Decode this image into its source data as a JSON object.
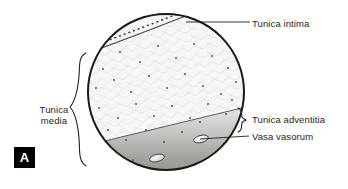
{
  "figure": {
    "panel_letter": "A",
    "background_color": "#ffffff",
    "text_color": "#231f20"
  },
  "labels": {
    "tunica_intima": "Tunica intima",
    "tunica_media_line1": "Tunica",
    "tunica_media_line2": "media",
    "tunica_adventitia": "Tunica adventitia",
    "vasa_vasorum": "Vasa vasorum"
  },
  "diagram": {
    "vessel_outline_color": "#1a1a1a",
    "media_fill_color": "#f4f4f2",
    "adventitia_fill_light": "#d9d9d7",
    "adventitia_fill_dark": "#8e8e8c",
    "intima_dot_color": "#3a3a3a",
    "nuclei_dot_color": "#444444",
    "vasa_vasorum_count": 2,
    "circle": {
      "center_x": 166,
      "center_y": 92,
      "radius": 78
    }
  }
}
